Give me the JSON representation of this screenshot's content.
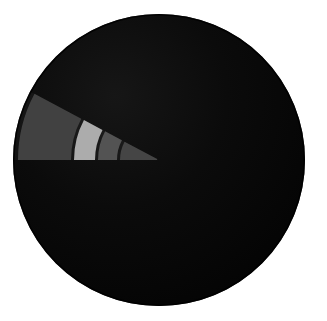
{
  "figure": {
    "title": "",
    "background_color": "#ffffff",
    "width": 327,
    "height": 321
  },
  "disc": {
    "name": "dark-circular-disc",
    "center_x": 159,
    "center_y": 160,
    "radius": 146,
    "fill_color": "#070707",
    "edge_color": "#000000",
    "highlight_color": "#151515"
  },
  "chart_data": {
    "type": "pie",
    "title": "",
    "subtitle": "",
    "xlabel": "",
    "ylabel": "",
    "legend_position": "none",
    "grid": false,
    "background_color": "#ffffff",
    "disc_fill": "#070707",
    "center": [
      159,
      160
    ],
    "outer_radius": 146,
    "wedge": {
      "apex_x": 153,
      "apex_y": 160,
      "start_angle_deg": 180,
      "end_angle_deg": 208,
      "span_deg": 28
    },
    "categories": [
      "band-1",
      "band-2",
      "band-3",
      "band-4"
    ],
    "values": [
      38,
      25,
      20,
      17
    ],
    "colors": [
      "#3b3b3b",
      "#a9a9a9",
      "#4d4d4d",
      "#3f3f3f"
    ],
    "segments": [
      {
        "label": "band-1",
        "index": 1,
        "color": "#3b3b3b",
        "inner_radius": 88,
        "outer_radius": 141,
        "position": "outermost"
      },
      {
        "label": "band-2",
        "index": 2,
        "color": "#a9a9a9",
        "inner_radius": 64,
        "outer_radius": 85,
        "position": "second"
      },
      {
        "label": "band-3",
        "index": 3,
        "color": "#4d4d4d",
        "inner_radius": 42,
        "outer_radius": 61,
        "position": "third"
      },
      {
        "label": "band-4",
        "index": 4,
        "color": "#3f3f3f",
        "inner_radius": 2,
        "outer_radius": 39,
        "position": "innermost"
      }
    ],
    "gap_color": "#080808",
    "gap_width_px": 3
  }
}
